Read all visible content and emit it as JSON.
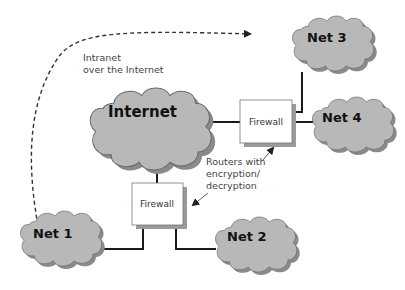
{
  "diagram": {
    "colors": {
      "cloud_fill": "#b8b8b8",
      "cloud_shadow": "#8a8a8a",
      "cloud_stroke": "#6a6a6a",
      "line": "#1a1a1a",
      "firewall_fill": "#ffffff",
      "firewall_shadow": "#9a9a9a",
      "text": "#111111",
      "note_text": "#444444"
    },
    "clouds": {
      "internet": {
        "label": "Internet"
      },
      "net1": {
        "label": "Net 1"
      },
      "net2": {
        "label": "Net 2"
      },
      "net3": {
        "label": "Net 3"
      },
      "net4": {
        "label": "Net 4"
      }
    },
    "firewalls": {
      "top": {
        "label": "Firewall"
      },
      "bottom": {
        "label": "Firewall"
      }
    },
    "annotations": {
      "intranet": {
        "line1": "Intranet",
        "line2": "over the Internet"
      },
      "routers": {
        "line1": "Routers with",
        "line2": "encryption/",
        "line3": "decryption"
      }
    }
  }
}
